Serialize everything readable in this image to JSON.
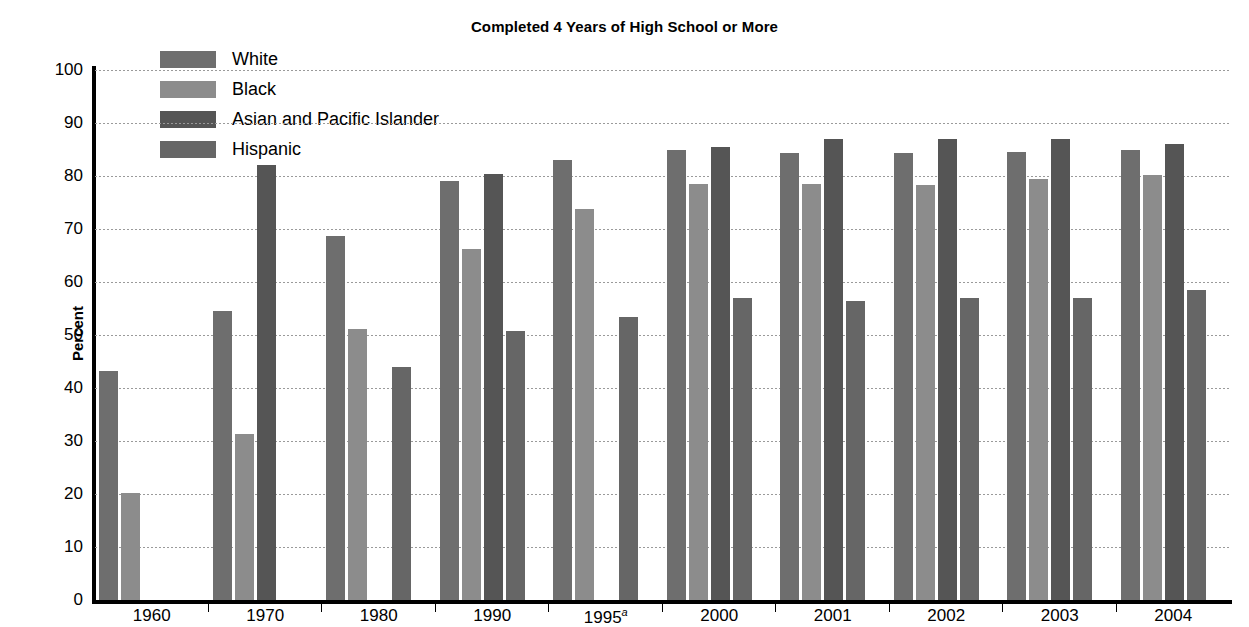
{
  "chart": {
    "title": "Completed 4 Years of High School or More",
    "ylabel": "Percent"
  },
  "legend": {
    "items": [
      {
        "label": "White",
        "color": "#6e6e6e"
      },
      {
        "label": "Black",
        "color": "#8c8c8c"
      },
      {
        "label": "Asian and Pacific Islander",
        "color": "#555555"
      },
      {
        "label": "Hispanic",
        "color": "#666666"
      }
    ]
  },
  "yticks": [
    "100",
    "90",
    "80",
    "70",
    "60",
    "50",
    "40",
    "30",
    "20",
    "10",
    "0"
  ],
  "xticks": [
    {
      "label": "1960",
      "note": ""
    },
    {
      "label": "1970",
      "note": ""
    },
    {
      "label": "1980",
      "note": ""
    },
    {
      "label": "1990",
      "note": ""
    },
    {
      "label": "1995",
      "note": "a"
    },
    {
      "label": "2000",
      "note": ""
    },
    {
      "label": "2001",
      "note": ""
    },
    {
      "label": "2002",
      "note": ""
    },
    {
      "label": "2003",
      "note": ""
    },
    {
      "label": "2004",
      "note": ""
    }
  ],
  "chart_data": {
    "type": "bar",
    "title": "Completed 4 Years of High School or More",
    "xlabel": "",
    "ylabel": "Percent",
    "ylim": [
      0,
      100
    ],
    "ytick_step": 10,
    "grid": true,
    "legend_position": "top-left",
    "categories": [
      "1960",
      "1970",
      "1980",
      "1990",
      "1995",
      "2000",
      "2001",
      "2002",
      "2003",
      "2004"
    ],
    "series": [
      {
        "name": "White",
        "color": "#6e6e6e",
        "values": [
          43.2,
          54.5,
          68.6,
          79.1,
          83.0,
          84.9,
          84.4,
          84.3,
          84.6,
          85.0
        ]
      },
      {
        "name": "Black",
        "color": "#8c8c8c",
        "values": [
          20.1,
          31.4,
          51.2,
          66.2,
          73.8,
          78.5,
          78.4,
          78.3,
          79.5,
          80.1
        ]
      },
      {
        "name": "Asian and Pacific Islander",
        "color": "#555555",
        "values": [
          null,
          82.0,
          null,
          80.4,
          null,
          85.5,
          87.0,
          86.9,
          87.0,
          86.0
        ]
      },
      {
        "name": "Hispanic",
        "color": "#666666",
        "values": [
          null,
          null,
          44.0,
          50.8,
          53.4,
          57.0,
          56.5,
          57.0,
          57.0,
          58.4
        ]
      }
    ],
    "notes": [
      {
        "marker": "a",
        "applies_to": "1995"
      }
    ]
  }
}
